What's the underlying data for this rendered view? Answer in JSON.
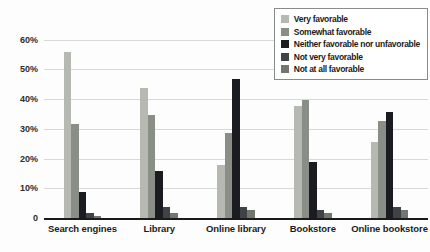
{
  "chart_data": {
    "type": "bar",
    "title": "",
    "xlabel": "",
    "ylabel": "",
    "categories": [
      "Search engines",
      "Library",
      "Online library",
      "Bookstore",
      "Online bookstore"
    ],
    "series": [
      {
        "name": "Very favorable",
        "color": "#b5b9b1",
        "values": [
          56,
          44,
          18,
          38,
          26
        ]
      },
      {
        "name": "Somewhat favorable",
        "color": "#898e87",
        "values": [
          32,
          35,
          29,
          40,
          33
        ]
      },
      {
        "name": "Neither favorable nor unfavorable",
        "color": "#1a1c21",
        "values": [
          9,
          16,
          47,
          19,
          36
        ]
      },
      {
        "name": "Not very favorable",
        "color": "#3f4347",
        "values": [
          2,
          4,
          4,
          3,
          4
        ]
      },
      {
        "name": "Not at all favorable",
        "color": "#71766f",
        "values": [
          1,
          2,
          3,
          2,
          3
        ]
      }
    ],
    "yticks": [
      {
        "label": "60%",
        "value": 60
      },
      {
        "label": "50%",
        "value": 50
      },
      {
        "label": "40%",
        "value": 40
      },
      {
        "label": "30%",
        "value": 30
      },
      {
        "label": "20%",
        "value": 20
      },
      {
        "label": "10%",
        "value": 10
      },
      {
        "label": "0",
        "value": 0
      }
    ],
    "ylim": [
      0,
      65
    ],
    "grid": true,
    "legend_position": "top-right",
    "baseline_color": "#1a1a1a",
    "gridline_color": "#d8d8d8"
  }
}
